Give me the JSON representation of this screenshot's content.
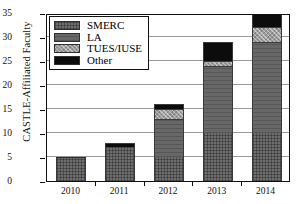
{
  "chart_data": {
    "type": "bar",
    "subtype": "stacked-bar",
    "title": "",
    "xlabel": "",
    "ylabel": "CASTLE-Affiliated Faculty",
    "categories": [
      "2010",
      "2011",
      "2012",
      "2013",
      "2014"
    ],
    "ylim": [
      0,
      35
    ],
    "yticks": [
      0,
      5,
      10,
      15,
      20,
      25,
      30,
      35
    ],
    "grid": true,
    "legend_position": "upper-left",
    "series": [
      {
        "name": "SMERC",
        "values": [
          5,
          7,
          5,
          10,
          10
        ],
        "color": "#6e6e6e",
        "pattern": "cross-hatch"
      },
      {
        "name": "LA",
        "values": [
          0,
          0,
          8,
          14,
          19
        ],
        "color": "#676767",
        "pattern": "solid-dark-gray"
      },
      {
        "name": "TUES/IUSE",
        "values": [
          0,
          0,
          2,
          1,
          3
        ],
        "color": "#9c9c9c",
        "pattern": "dotted-light"
      },
      {
        "name": "Other",
        "values": [
          0,
          1,
          1,
          4,
          3
        ],
        "color": "#0c0c0c",
        "pattern": "solid-black"
      }
    ],
    "totals": [
      5,
      8,
      16,
      29,
      35
    ]
  },
  "axes": {
    "y_title": "CASTLE-Affiliated Faculty",
    "y_tick_labels": [
      "0",
      "5",
      "10",
      "15",
      "20",
      "25",
      "30",
      "35"
    ],
    "x_tick_labels": [
      "2010",
      "2011",
      "2012",
      "2013",
      "2014"
    ]
  },
  "legend": {
    "items": [
      {
        "label": "SMERC"
      },
      {
        "label": "LA"
      },
      {
        "label": "TUES/IUSE"
      },
      {
        "label": "Other"
      }
    ]
  }
}
